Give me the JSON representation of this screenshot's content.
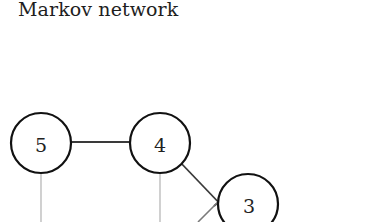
{
  "title": "Markov network",
  "graph": {
    "nodes": [
      {
        "id": "5",
        "label": "5",
        "cx": 41,
        "cy": 143,
        "r": 30
      },
      {
        "id": "4",
        "label": "4",
        "cx": 160,
        "cy": 143,
        "r": 30
      },
      {
        "id": "3",
        "label": "3",
        "cx": 248,
        "cy": 204,
        "r": 30
      }
    ],
    "edges": [
      {
        "from": "5",
        "to": "4",
        "style": "dark"
      },
      {
        "from": "4",
        "to": "3",
        "style": "dark"
      },
      {
        "from": "5",
        "to": "offscreen-below",
        "style": "faint"
      },
      {
        "from": "4",
        "to": "offscreen-below",
        "style": "faint"
      },
      {
        "from": "offscreen-below-left",
        "to": "3",
        "style": "mid"
      }
    ],
    "colors": {
      "node_stroke": "#111111",
      "edge_dark": "#3a3a3a",
      "edge_faint": "#bdbdbd",
      "background": "#ffffff"
    }
  }
}
